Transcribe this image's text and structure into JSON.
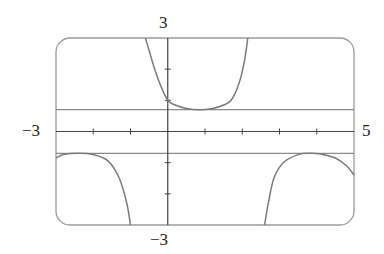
{
  "chart_data": {
    "type": "line",
    "title": "",
    "xlabel": "",
    "ylabel": "",
    "xlim": [
      -3,
      5
    ],
    "ylim": [
      -3,
      3
    ],
    "grid": false,
    "legend": null,
    "axis_labels": {
      "x_min": "−3",
      "x_max": "5",
      "y_max": "3",
      "y_min": "−3"
    },
    "x_ticks": [
      -2,
      -1,
      1,
      2,
      3,
      4
    ],
    "y_ticks": [
      -2,
      -1,
      1,
      2
    ],
    "horizontal_asymptotes": [
      0.7,
      -0.7
    ],
    "series": [
      {
        "name": "upper-branch",
        "x": [
          -0.6,
          -0.5,
          -0.35,
          -0.2,
          0,
          0.2,
          0.5,
          0.85,
          1.2,
          1.5,
          1.7,
          1.9,
          2.05,
          2.15
        ],
        "y": [
          3.0,
          2.6,
          2.0,
          1.5,
          1.0,
          0.85,
          0.74,
          0.7,
          0.74,
          0.85,
          1.0,
          1.5,
          2.2,
          3.0
        ]
      },
      {
        "name": "lower-left-branch",
        "x": [
          -3,
          -2.8,
          -2.4,
          -2.0,
          -1.6,
          -1.3,
          -1.1,
          -1.0
        ],
        "y": [
          -0.85,
          -0.74,
          -0.7,
          -0.74,
          -0.95,
          -1.5,
          -2.3,
          -3.0
        ]
      },
      {
        "name": "lower-right-branch",
        "x": [
          2.6,
          2.7,
          2.85,
          3.1,
          3.5,
          3.8,
          4.1,
          4.5,
          4.8,
          5.0
        ],
        "y": [
          -3.0,
          -2.3,
          -1.5,
          -1.0,
          -0.74,
          -0.7,
          -0.72,
          -0.85,
          -1.1,
          -1.4
        ]
      }
    ]
  },
  "style": {
    "curve_color": "#7a7a7a",
    "axis_color": "#444444",
    "frame_color": "#9a9a9a",
    "asymptote_color": "#8a8a8a",
    "background": "#ffffff"
  }
}
